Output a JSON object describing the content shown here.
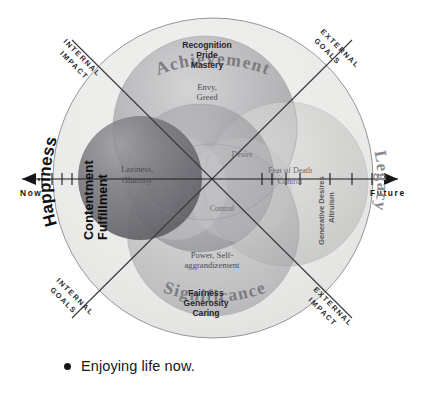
{
  "diagram": {
    "axes": {
      "horizontal_left_label": "Now",
      "horizontal_right_label": "Future",
      "corner_labels": {
        "top_left": [
          "INTERNAL",
          "IMPACT"
        ],
        "top_right": [
          "EXTERNAL",
          "GOALS"
        ],
        "bottom_left": [
          "INTERNAL",
          "GOALS"
        ],
        "bottom_right": [
          "EXTERNAL",
          "IMPACT"
        ]
      }
    },
    "quadrants": {
      "top": "Achievement",
      "bottom": "Significance",
      "left": "Happiness",
      "right": "Legacy"
    },
    "inner_labels": {
      "top_cluster": [
        "Recognition",
        "Pride",
        "Mastery"
      ],
      "left_vertical": [
        "Contentment",
        "Fulfillment"
      ],
      "right_vertical": [
        "Altruism",
        "Generative Desires"
      ],
      "bottom_cluster": [
        "Fairness",
        "Generosity",
        "Caring"
      ]
    },
    "shadow_labels": [
      {
        "name": "envy-greed",
        "lines": [
          "Envy,",
          "Greed"
        ]
      },
      {
        "name": "laziness-gluttony",
        "lines": [
          "Laziness,",
          "Gluttony"
        ]
      },
      {
        "name": "desire",
        "lines": [
          "Desire"
        ]
      },
      {
        "name": "fear-of-death-control",
        "lines": [
          "Fear of Death",
          "Control"
        ]
      },
      {
        "name": "control",
        "lines": [
          "Control"
        ]
      },
      {
        "name": "power-self-aggrandizement",
        "lines": [
          "Power, Self-",
          "aggrandizement"
        ]
      }
    ],
    "colors": {
      "outer_ring": "#e9e9e7",
      "sphere_achievement": "#a9a9ad",
      "sphere_happiness": "#7d7d83",
      "sphere_legacy": "#cfcfcd",
      "sphere_significance": "#b9b9bb",
      "axis": "#1d1d20",
      "text_dark": "#17171a"
    }
  },
  "bullet": {
    "marker": "bullet-dot",
    "text": "Enjoying life now."
  }
}
